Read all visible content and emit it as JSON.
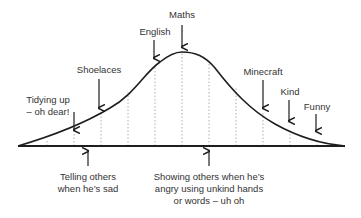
{
  "diagram": {
    "type": "bell-curve",
    "colors": {
      "line": "#1e1e1e",
      "dotted": "#9a9a9a",
      "text": "#333333"
    },
    "top_labels": [
      {
        "id": "tidying",
        "text": "Tidying up\n– oh dear!",
        "x": 48,
        "y": 100
      },
      {
        "id": "shoelaces",
        "text": "Shoelaces",
        "x": 98,
        "y": 66
      },
      {
        "id": "english",
        "text": "English",
        "x": 155,
        "y": 27
      },
      {
        "id": "maths",
        "text": "Maths",
        "x": 182,
        "y": 9
      },
      {
        "id": "minecraft",
        "text": "Minecraft",
        "x": 263,
        "y": 66
      },
      {
        "id": "kind",
        "text": "Kind",
        "x": 290,
        "y": 87
      },
      {
        "id": "funny",
        "text": "Funny",
        "x": 316,
        "y": 101
      }
    ],
    "bottom_labels": [
      {
        "id": "telling-others-sad",
        "text": "Telling others\nwhen he’s sad",
        "x": 88,
        "y": 168
      },
      {
        "id": "showing-others-angry",
        "text": "Showing others when he’s\nangry using unkind hands\nor words – uh oh",
        "x": 208,
        "y": 168
      }
    ]
  }
}
